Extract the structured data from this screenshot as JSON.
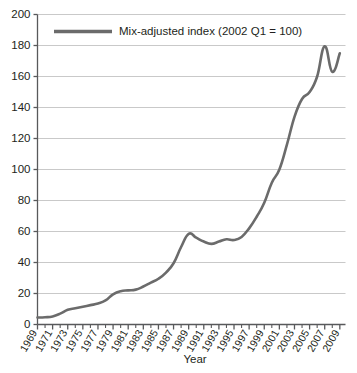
{
  "chart_data": {
    "type": "line",
    "title": "",
    "xlabel": "Year",
    "ylabel": "",
    "xlim": [
      1969,
      2009.75
    ],
    "ylim": [
      0,
      200
    ],
    "grid": true,
    "grid_axis": "y",
    "legend_position": "top-center-inside",
    "line_color": "#6b6b6b",
    "grid_color": "#c9c9c9",
    "axis_color": "#58595b",
    "background_color": "#ffffff",
    "series": [
      {
        "name": "Mix-adjusted index (2002 Q1 = 100)",
        "x": [
          1969,
          1970,
          1971,
          1972,
          1973,
          1974,
          1975,
          1976,
          1977,
          1978,
          1979,
          1980,
          1981,
          1982,
          1983,
          1984,
          1985,
          1986,
          1987,
          1988,
          1989,
          1990,
          1991,
          1992,
          1993,
          1994,
          1995,
          1996,
          1997,
          1998,
          1999,
          2000,
          2001,
          2002,
          2003,
          2004,
          2005,
          2006,
          2007,
          2008,
          2009
        ],
        "values": [
          4.5,
          4.7,
          5.2,
          7.0,
          9.5,
          10.5,
          11.5,
          12.5,
          13.5,
          15.5,
          19.5,
          21.5,
          22.0,
          22.5,
          24.5,
          27.0,
          29.5,
          33.5,
          39.5,
          50.0,
          58.5,
          56.0,
          53.5,
          52.0,
          53.5,
          55.0,
          54.5,
          56.5,
          62.0,
          69.5,
          78.5,
          91.5,
          100.0,
          116.0,
          134.0,
          145.5,
          150.0,
          160.0,
          179.5,
          163.0,
          175.0
        ]
      }
    ],
    "ytick_values": [
      0,
      20,
      40,
      60,
      80,
      100,
      120,
      140,
      160,
      180,
      200
    ],
    "ytick_labels": [
      "0",
      "20",
      "40",
      "60",
      "80",
      "100",
      "120",
      "140",
      "160",
      "180",
      "200"
    ],
    "xtick_values": [
      1969,
      1971,
      1973,
      1975,
      1977,
      1979,
      1981,
      1983,
      1985,
      1987,
      1989,
      1991,
      1993,
      1995,
      1997,
      1999,
      2001,
      2003,
      2005,
      2007,
      2009
    ],
    "xtick_labels": [
      "1969",
      "1971",
      "1973",
      "1975",
      "1977",
      "1979",
      "1981",
      "1983",
      "1985",
      "1987",
      "1989",
      "1991",
      "1993",
      "1995",
      "1997",
      "1999",
      "2001",
      "2003",
      "2005",
      "2007",
      "2009"
    ],
    "xminor_values": [
      1970,
      1972,
      1974,
      1976,
      1978,
      1980,
      1982,
      1984,
      1986,
      1988,
      1990,
      1992,
      1994,
      1996,
      1998,
      2000,
      2002,
      2004,
      2006,
      2008
    ],
    "legend": {
      "entries": [
        {
          "label": "Mix-adjusted index (2002 Q1 = 100)",
          "color": "#6b6b6b"
        }
      ]
    }
  }
}
